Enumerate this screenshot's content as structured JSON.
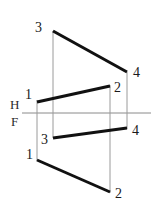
{
  "figure": {
    "background_color": "#ffffff",
    "width": 155,
    "height": 206
  },
  "reference_line": {
    "name": "H-F folding line",
    "label_top": "H",
    "label_bottom": "F",
    "color": "#8a8a8a",
    "x1": 22,
    "y1": 113,
    "x2": 151,
    "y2": 113,
    "label_top_x": 10,
    "label_top_y": 109,
    "label_bottom_x": 11,
    "label_bottom_y": 126
  },
  "style": {
    "object_line_color": "#111111",
    "object_line_width": 3,
    "projector_line_color": "#9a9a9a",
    "projector_line_width": 1,
    "label_color": "#1a1a1a"
  },
  "chart_data": {
    "type": "diagram",
    "views": [
      {
        "name": "horizontal-view",
        "position": "above H-F line",
        "lines": [
          {
            "name": "line-3-4-top",
            "from_label": "3",
            "to_label": "4",
            "x1": 53,
            "y1": 31,
            "x2": 127,
            "y2": 72
          },
          {
            "name": "line-1-2-top",
            "from_label": "1",
            "to_label": "2",
            "x1": 37,
            "y1": 102,
            "x2": 110,
            "y2": 86
          }
        ]
      },
      {
        "name": "frontal-view",
        "position": "below H-F line",
        "lines": [
          {
            "name": "line-3-4-bottom",
            "from_label": "3",
            "to_label": "4",
            "x1": 53,
            "y1": 138,
            "x2": 127,
            "y2": 128
          },
          {
            "name": "line-1-2-bottom",
            "from_label": "1",
            "to_label": "2",
            "x1": 37,
            "y1": 160,
            "x2": 110,
            "y2": 192
          }
        ]
      }
    ],
    "projectors": [
      {
        "name": "projector-point-3",
        "x": 53,
        "y1": 31,
        "y2": 138
      },
      {
        "name": "projector-point-1",
        "x": 37,
        "y1": 100,
        "y2": 161
      },
      {
        "name": "projector-point-2",
        "x": 110,
        "y1": 85,
        "y2": 193
      },
      {
        "name": "projector-point-4",
        "x": 127,
        "y1": 72,
        "y2": 129
      }
    ],
    "point_labels": [
      {
        "name": "label-3-top",
        "text": "3",
        "x": 42,
        "y": 32,
        "anchor": "end"
      },
      {
        "name": "label-4-top",
        "text": "4",
        "x": 133,
        "y": 77,
        "anchor": "start"
      },
      {
        "name": "label-1-top",
        "text": "1",
        "x": 32,
        "y": 99,
        "anchor": "end"
      },
      {
        "name": "label-2-top",
        "text": "2",
        "x": 114,
        "y": 92,
        "anchor": "start"
      },
      {
        "name": "label-3-bottom",
        "text": "3",
        "x": 48,
        "y": 144,
        "anchor": "end"
      },
      {
        "name": "label-4-bottom",
        "text": "4",
        "x": 132,
        "y": 135,
        "anchor": "start"
      },
      {
        "name": "label-1-bottom",
        "text": "1",
        "x": 33,
        "y": 159,
        "anchor": "end"
      },
      {
        "name": "label-2-bottom",
        "text": "2",
        "x": 115,
        "y": 198,
        "anchor": "start"
      }
    ]
  }
}
